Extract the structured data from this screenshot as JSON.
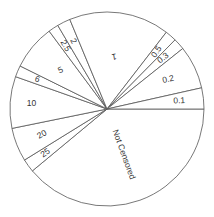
{
  "chart_data": {
    "type": "pie",
    "title": "",
    "legend": "none",
    "start_angle_deg": 0,
    "direction": "clockwise",
    "categories": [
      "Not Censored",
      "25",
      "20",
      "10",
      "6",
      "5",
      "2.5",
      "2",
      "1",
      "0.5",
      "0.3",
      "0.2",
      "0.1"
    ],
    "values": [
      38.9,
      2.2,
      5.6,
      8.6,
      1.9,
      7.5,
      1.7,
      2.2,
      16.7,
      1.9,
      1.9,
      7.2,
      3.5
    ],
    "label_rotations": [
      70,
      -35,
      -30,
      0,
      18,
      -25,
      60,
      62,
      170,
      -55,
      -38,
      -12,
      -3
    ]
  },
  "style": {
    "stroke": "#555555",
    "fill": "#ffffff",
    "label_color": "#333333"
  }
}
